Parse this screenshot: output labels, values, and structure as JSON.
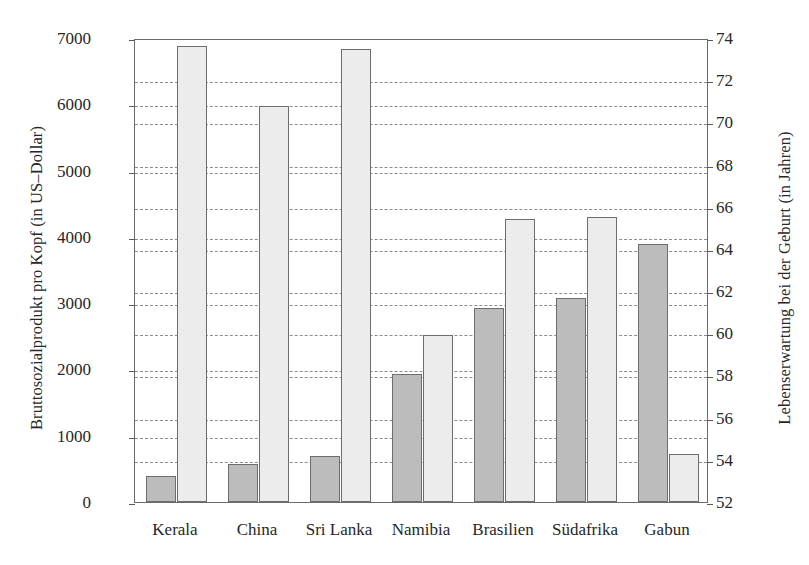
{
  "chart_data": {
    "type": "bar",
    "title": "",
    "categories": [
      "Kerala",
      "China",
      "Sri Lanka",
      "Namibia",
      "Brasilien",
      "Südafrika",
      "Gabun"
    ],
    "series": [
      {
        "name": "Bruttosozialprodukt pro Kopf (in US-Dollar)",
        "axis": "left",
        "color": "#bcbcbc",
        "values": [
          400,
          570,
          690,
          1930,
          2930,
          3080,
          3890
        ]
      },
      {
        "name": "Lebenserwartung bei der Geburt (in Jahren)",
        "axis": "right",
        "color": "#ececec",
        "values": [
          73.6,
          70.8,
          73.5,
          59.9,
          65.4,
          65.5,
          54.3
        ]
      }
    ],
    "left_axis": {
      "label": "Bruttosozialprodukt pro Kopf (in US–Dollar)",
      "ticks": [
        0,
        1000,
        2000,
        3000,
        4000,
        5000,
        6000,
        7000
      ],
      "ticklabels": [
        "0",
        "1000",
        "2000",
        "3000",
        "4000",
        "5000",
        "6000",
        "7000"
      ],
      "min": 0,
      "max": 7000
    },
    "right_axis": {
      "label": "Lebenserwartung bei der Geburt (in Jahren)",
      "ticks": [
        52,
        54,
        56,
        58,
        60,
        62,
        64,
        66,
        68,
        70,
        72,
        74
      ],
      "ticklabels": [
        "52",
        "54",
        "56",
        "58",
        "60",
        "62",
        "64",
        "66",
        "68",
        "70",
        "72",
        "74"
      ],
      "min": 52,
      "max": 74
    },
    "xlabel": "",
    "grid": true,
    "grid_style": "dashed",
    "legend": "none"
  }
}
